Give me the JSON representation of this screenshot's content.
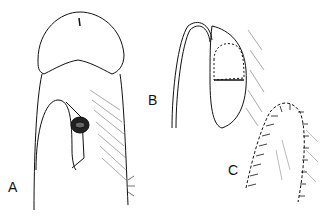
{
  "figure": {
    "panels": [
      {
        "label": "A",
        "description": "Ventral view showing U-shaped incision with urethral opening"
      },
      {
        "label": "B",
        "description": "Flap rotated with graft sutured in place"
      },
      {
        "label": "C",
        "description": "Final sutured closure"
      }
    ],
    "colors": {
      "ink": "#111111",
      "background": "#ffffff"
    }
  }
}
